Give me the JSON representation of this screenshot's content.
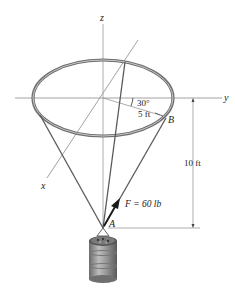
{
  "figure": {
    "type": "statics-3d-diagram",
    "axes": {
      "x_label": "x",
      "y_label": "y",
      "z_label": "z"
    },
    "points": {
      "A": "A",
      "B": "B"
    },
    "force": {
      "label": "F = 60 lb",
      "symbol": "F",
      "magnitude": "60 lb"
    },
    "dimensions": {
      "radius": "5 ft",
      "angle": "30°",
      "height": "10 ft"
    },
    "colors": {
      "axis": "#8a8a8a",
      "ring": "#7a7a7a",
      "cable": "#5a5a5a",
      "arrow": "#1a1a1a",
      "text": "#222222"
    }
  }
}
